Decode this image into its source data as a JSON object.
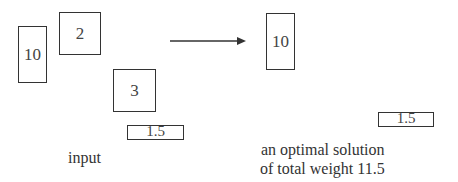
{
  "input_section": {
    "label": "input",
    "rectangles": [
      {
        "weight": "10"
      },
      {
        "weight": "2"
      },
      {
        "weight": "3"
      },
      {
        "weight": "1.5"
      }
    ]
  },
  "arrow": {
    "direction": "right"
  },
  "output_section": {
    "label_line1": "an optimal solution",
    "label_line2": "of total weight 11.5",
    "rectangles": [
      {
        "weight": "10"
      },
      {
        "weight": "1.5"
      }
    ]
  },
  "colors": {
    "stroke": "#333333",
    "text": "#444444",
    "background": "#ffffff"
  }
}
